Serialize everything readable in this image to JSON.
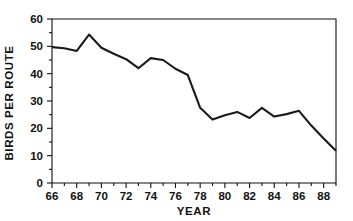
{
  "chart_data": {
    "type": "line",
    "title": "",
    "xlabel": "YEAR",
    "ylabel": "BIRDS PER ROUTE",
    "xlim": [
      66,
      89
    ],
    "ylim": [
      0,
      60
    ],
    "grid": false,
    "legend": null,
    "x_tick_labels": [
      "66",
      "68",
      "70",
      "72",
      "74",
      "76",
      "78",
      "80",
      "82",
      "84",
      "86",
      "88"
    ],
    "x_tick_values": [
      66,
      68,
      70,
      72,
      74,
      76,
      78,
      80,
      82,
      84,
      86,
      88
    ],
    "x_minor_ticks": [
      67,
      69,
      71,
      73,
      75,
      77,
      79,
      81,
      83,
      85,
      87,
      89
    ],
    "y_tick_labels": [
      "0",
      "10",
      "20",
      "30",
      "40",
      "50",
      "60"
    ],
    "y_tick_values": [
      0,
      10,
      20,
      30,
      40,
      50,
      60
    ],
    "y_minor_ticks": [
      5,
      15,
      25,
      35,
      45,
      55
    ],
    "line_color": "#1a1a1a",
    "axis_color": "#111111",
    "background_color": "#ffffff",
    "x": [
      66,
      67,
      68,
      69,
      70,
      71,
      72,
      73,
      74,
      75,
      76,
      77,
      78,
      79,
      80,
      81,
      82,
      83,
      84,
      85,
      86,
      87,
      88,
      89
    ],
    "values": [
      49.7,
      49.3,
      48.3,
      54.3,
      49.5,
      47.3,
      45.3,
      42.0,
      45.7,
      45.0,
      41.8,
      39.5,
      27.5,
      23.2,
      24.8,
      26.0,
      23.8,
      27.5,
      24.3,
      25.2,
      26.4,
      21.0,
      16.3,
      11.8
    ],
    "series": [
      {
        "name": "Birds per route",
        "values": [
          49.7,
          49.3,
          48.3,
          54.3,
          49.5,
          47.3,
          45.3,
          42.0,
          45.7,
          45.0,
          41.8,
          39.5,
          27.5,
          23.2,
          24.8,
          26.0,
          23.8,
          27.5,
          24.3,
          25.2,
          26.4,
          21.0,
          16.3,
          11.8
        ]
      }
    ]
  }
}
